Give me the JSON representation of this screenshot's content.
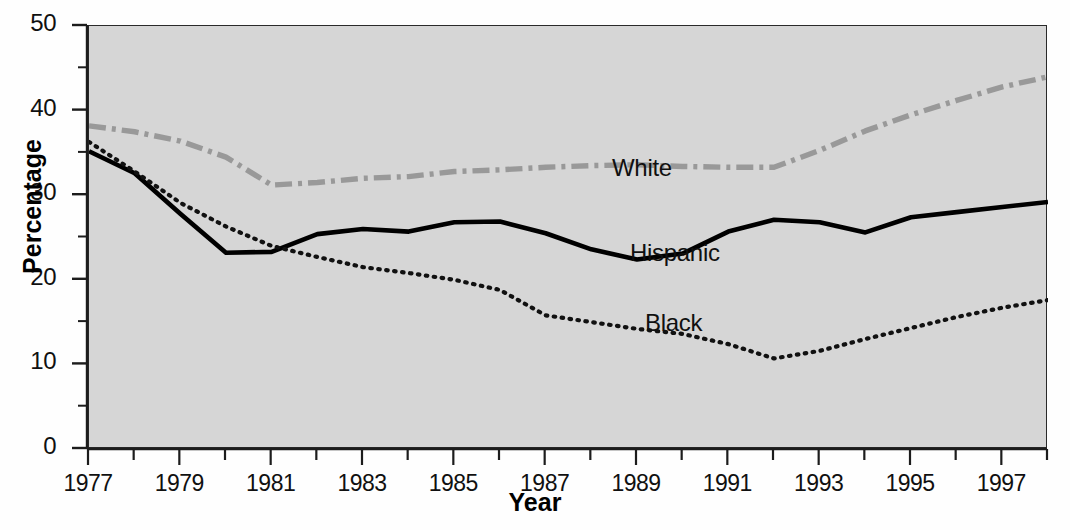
{
  "chart_data": {
    "type": "line",
    "title": "",
    "xlabel": "Year",
    "ylabel": "Percentage",
    "xlim": [
      1977,
      1998
    ],
    "ylim": [
      0,
      50
    ],
    "grid": false,
    "legend_position": "inline-annotations",
    "x": [
      1977,
      1978,
      1979,
      1980,
      1981,
      1982,
      1983,
      1984,
      1985,
      1986,
      1987,
      1988,
      1989,
      1990,
      1991,
      1992,
      1993,
      1994,
      1995,
      1996,
      1997,
      1998
    ],
    "xticks_major": [
      1977,
      1979,
      1981,
      1983,
      1985,
      1987,
      1989,
      1991,
      1993,
      1995,
      1997
    ],
    "xtick_labels": [
      "1977",
      "1979",
      "1981",
      "1983",
      "1985",
      "1987",
      "1989",
      "1991",
      "1993",
      "1995",
      "1997"
    ],
    "yticks_major": [
      0,
      10,
      20,
      30,
      40,
      50
    ],
    "ytick_labels": [
      "0",
      "10",
      "20",
      "30",
      "40",
      "50"
    ],
    "yticks_minor": [
      5,
      15,
      25,
      35,
      45
    ],
    "series": [
      {
        "name": "White",
        "label": "White",
        "color": "#999999",
        "style": "dash-dot",
        "values": [
          38.2,
          37.5,
          36.4,
          34.5,
          31.2,
          31.5,
          32.0,
          32.2,
          32.8,
          33.0,
          33.3,
          33.5,
          33.6,
          33.4,
          33.3,
          33.3,
          35.3,
          37.6,
          39.5,
          41.2,
          42.8,
          44.0
        ]
      },
      {
        "name": "Hispanic",
        "label": "Hispanic",
        "color": "#000000",
        "style": "solid",
        "values": [
          35.2,
          32.6,
          27.8,
          23.2,
          23.3,
          25.4,
          26.0,
          25.7,
          26.8,
          26.9,
          25.5,
          23.6,
          22.4,
          23.1,
          25.7,
          27.1,
          26.8,
          25.6,
          27.4,
          28.0,
          28.6,
          29.2
        ]
      },
      {
        "name": "Black",
        "label": "Black",
        "color": "#111111",
        "style": "dotted",
        "values": [
          36.3,
          32.8,
          29.1,
          26.3,
          24.0,
          22.7,
          21.5,
          20.8,
          20.0,
          18.8,
          15.8,
          15.0,
          14.2,
          13.6,
          12.4,
          10.7,
          11.6,
          13.0,
          14.3,
          15.6,
          16.7,
          17.6
        ]
      }
    ]
  },
  "axis": {
    "ylabel_text": "Percentage",
    "xlabel_text": "Year"
  }
}
